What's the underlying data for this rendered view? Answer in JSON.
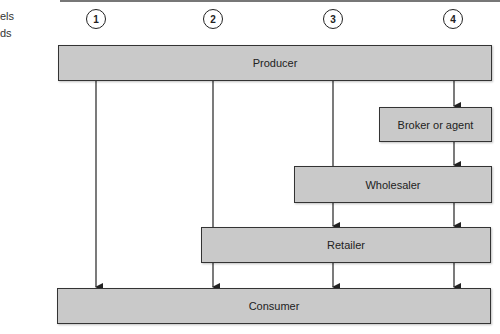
{
  "caption": {
    "line1": "els",
    "line2": "ds"
  },
  "channels": [
    {
      "number": "1"
    },
    {
      "number": "2"
    },
    {
      "number": "3"
    },
    {
      "number": "4"
    }
  ],
  "nodes": {
    "producer": "Producer",
    "broker": "Broker or agent",
    "wholesaler": "Wholesaler",
    "retailer": "Retailer",
    "consumer": "Consumer"
  },
  "colors": {
    "box_fill": "#c9c9c9",
    "stroke": "#222222"
  }
}
